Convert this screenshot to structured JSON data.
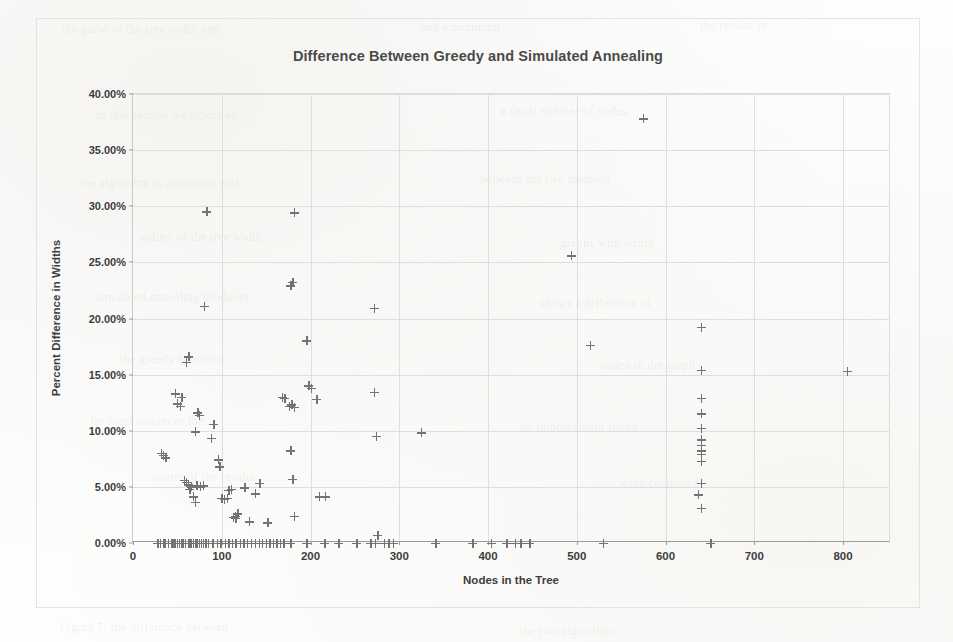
{
  "chart_data": {
    "type": "scatter",
    "title": "Difference Between Greedy and Simulated Annealing",
    "xlabel": "Nodes in the Tree",
    "ylabel": "Percent Difference in Widths",
    "xlim": [
      0,
      854
    ],
    "ylim": [
      0,
      40
    ],
    "xticks": [
      0,
      100,
      200,
      300,
      400,
      500,
      600,
      700,
      800
    ],
    "xtick_labels": [
      "0",
      "100",
      "200",
      "300",
      "400",
      "500",
      "600",
      "700",
      "800"
    ],
    "yticks": [
      0,
      5,
      10,
      15,
      20,
      25,
      30,
      35,
      40
    ],
    "ytick_labels": [
      "0.00%",
      "5.00%",
      "10.00%",
      "15.00%",
      "20.00%",
      "25.00%",
      "30.00%",
      "35.00%",
      "40.00%"
    ],
    "grid": true,
    "legend": false,
    "marker": "plus",
    "marker_color": "#737373",
    "yunit": "percent",
    "series": [
      {
        "name": "Percent Difference in Widths",
        "points": [
          [
            28,
            0
          ],
          [
            31,
            0
          ],
          [
            34,
            0
          ],
          [
            36,
            0
          ],
          [
            40,
            0
          ],
          [
            43,
            0
          ],
          [
            45,
            0
          ],
          [
            47,
            0
          ],
          [
            50,
            0
          ],
          [
            52,
            0
          ],
          [
            55,
            0
          ],
          [
            57,
            0
          ],
          [
            59,
            0
          ],
          [
            62,
            0
          ],
          [
            64,
            0
          ],
          [
            66,
            0
          ],
          [
            68,
            0
          ],
          [
            70,
            0
          ],
          [
            72,
            0
          ],
          [
            75,
            0
          ],
          [
            77,
            0
          ],
          [
            79,
            0
          ],
          [
            82,
            0
          ],
          [
            85,
            0
          ],
          [
            90,
            0
          ],
          [
            95,
            0
          ],
          [
            99,
            0
          ],
          [
            104,
            0
          ],
          [
            108,
            0
          ],
          [
            112,
            0
          ],
          [
            116,
            0
          ],
          [
            121,
            0
          ],
          [
            125,
            0
          ],
          [
            129,
            0
          ],
          [
            133,
            0
          ],
          [
            138,
            0
          ],
          [
            142,
            0
          ],
          [
            146,
            0
          ],
          [
            150,
            0
          ],
          [
            154,
            0
          ],
          [
            158,
            0
          ],
          [
            162,
            0
          ],
          [
            166,
            0
          ],
          [
            170,
            0
          ],
          [
            178,
            0
          ],
          [
            196,
            0
          ],
          [
            216,
            0
          ],
          [
            232,
            0
          ],
          [
            252,
            0
          ],
          [
            268,
            0
          ],
          [
            273,
            0
          ],
          [
            283,
            0
          ],
          [
            288,
            0
          ],
          [
            293,
            0
          ],
          [
            341,
            0
          ],
          [
            383,
            0
          ],
          [
            404,
            0
          ],
          [
            421,
            0
          ],
          [
            431,
            0
          ],
          [
            437,
            0
          ],
          [
            447,
            0
          ],
          [
            530,
            0
          ],
          [
            651,
            0
          ],
          [
            32,
            8.0
          ],
          [
            34,
            7.8
          ],
          [
            37,
            7.6
          ],
          [
            48,
            13.3
          ],
          [
            50,
            12.4
          ],
          [
            53,
            12.2
          ],
          [
            55,
            13.0
          ],
          [
            60,
            16.1
          ],
          [
            63,
            16.6
          ],
          [
            58,
            5.6
          ],
          [
            60,
            5.4
          ],
          [
            62,
            5.2
          ],
          [
            64,
            4.8
          ],
          [
            66,
            5.0
          ],
          [
            68,
            4.1
          ],
          [
            70,
            3.6
          ],
          [
            72,
            5.1
          ],
          [
            76,
            5.0
          ],
          [
            79,
            5.1
          ],
          [
            70,
            9.9
          ],
          [
            73,
            11.6
          ],
          [
            75,
            11.4
          ],
          [
            80,
            21.1
          ],
          [
            83,
            29.5
          ],
          [
            88,
            9.3
          ],
          [
            91,
            10.6
          ],
          [
            96,
            7.4
          ],
          [
            98,
            6.8
          ],
          [
            100,
            4.0
          ],
          [
            103,
            3.9
          ],
          [
            106,
            4.0
          ],
          [
            108,
            4.7
          ],
          [
            111,
            4.8
          ],
          [
            113,
            2.3
          ],
          [
            115,
            2.4
          ],
          [
            116,
            2.2
          ],
          [
            118,
            2.6
          ],
          [
            126,
            4.9
          ],
          [
            131,
            1.9
          ],
          [
            138,
            4.4
          ],
          [
            143,
            5.3
          ],
          [
            152,
            1.8
          ],
          [
            168,
            13.0
          ],
          [
            171,
            12.9
          ],
          [
            176,
            12.2
          ],
          [
            179,
            12.3
          ],
          [
            182,
            12.1
          ],
          [
            178,
            22.9
          ],
          [
            180,
            23.2
          ],
          [
            182,
            29.4
          ],
          [
            178,
            8.2
          ],
          [
            180,
            5.7
          ],
          [
            182,
            2.4
          ],
          [
            196,
            18.0
          ],
          [
            198,
            14.0
          ],
          [
            201,
            13.8
          ],
          [
            207,
            12.8
          ],
          [
            210,
            4.1
          ],
          [
            217,
            4.1
          ],
          [
            272,
            20.9
          ],
          [
            272,
            13.4
          ],
          [
            274,
            9.5
          ],
          [
            276,
            0.7
          ],
          [
            325,
            9.8
          ],
          [
            494,
            25.6
          ],
          [
            515,
            17.6
          ],
          [
            575,
            37.8
          ],
          [
            640,
            19.2
          ],
          [
            640,
            15.4
          ],
          [
            640,
            12.9
          ],
          [
            640,
            11.5
          ],
          [
            640,
            10.2
          ],
          [
            640,
            9.2
          ],
          [
            640,
            8.7
          ],
          [
            640,
            8.2
          ],
          [
            640,
            7.9
          ],
          [
            640,
            7.3
          ],
          [
            640,
            5.3
          ],
          [
            637,
            4.3
          ],
          [
            640,
            3.1
          ],
          [
            805,
            15.3
          ]
        ]
      }
    ]
  },
  "ghost_text": [
    {
      "x": 62,
      "y": 22,
      "t": "the parse of the tree width and",
      "size": 12
    },
    {
      "x": 420,
      "y": 20,
      "t": "and a minimum",
      "size": 12
    },
    {
      "x": 700,
      "y": 18,
      "t": "the results in",
      "size": 12
    },
    {
      "x": 96,
      "y": 108,
      "t": "in this section we report on",
      "size": 12
    },
    {
      "x": 500,
      "y": 104,
      "t": "a small number of nodes",
      "size": 12
    },
    {
      "x": 80,
      "y": 176,
      "t": "the algorithm is compared with",
      "size": 12
    },
    {
      "x": 480,
      "y": 172,
      "t": "between the two methods",
      "size": 12
    },
    {
      "x": 140,
      "y": 230,
      "t": "values of the tree width",
      "size": 12
    },
    {
      "x": 560,
      "y": 236,
      "t": "graphs with larger",
      "size": 12
    },
    {
      "x": 96,
      "y": 290,
      "t": "simulated annealing produces",
      "size": 12
    },
    {
      "x": 540,
      "y": 296,
      "t": "shows a difference of",
      "size": 12
    },
    {
      "x": 120,
      "y": 352,
      "t": "the greedy heuristic",
      "size": 12
    },
    {
      "x": 600,
      "y": 358,
      "t": "nodes in the graph",
      "size": 12
    },
    {
      "x": 90,
      "y": 414,
      "t": "for most instances the",
      "size": 12
    },
    {
      "x": 520,
      "y": 420,
      "t": "no improvement found",
      "size": 12
    },
    {
      "x": 150,
      "y": 470,
      "t": "scatter of the results",
      "size": 12
    },
    {
      "x": 620,
      "y": 476,
      "t": "were computed",
      "size": 12
    },
    {
      "x": 60,
      "y": 620,
      "t": "Figure 5: the difference between",
      "size": 12
    },
    {
      "x": 520,
      "y": 624,
      "t": "the two algorithms",
      "size": 12
    }
  ]
}
